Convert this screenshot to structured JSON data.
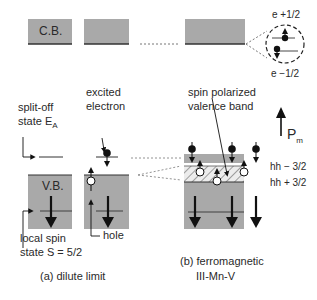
{
  "conduction_band": {
    "label": "C.B.",
    "spin_levels": {
      "up": "e +1/2",
      "down": "e −1/2"
    }
  },
  "panel_a": {
    "caption": "(a) dilute limit",
    "valence_band_label": "V.B.",
    "split_off_label_line1": "split-off",
    "split_off_label_line2": "state E",
    "split_off_subscript": "A",
    "excited_label_line1": "excited",
    "excited_label_line2": "electron",
    "local_spin_line1": "local spin",
    "local_spin_line2": "state S = 5/2",
    "hole_label": "hole"
  },
  "panel_b": {
    "caption_line1": "(b) ferromagnetic",
    "caption_line2": "III-Mn-V",
    "spin_polarized_line1": "spin polarized",
    "spin_polarized_line2": "valence band",
    "magnetization_label": "P",
    "magnetization_subscript": "m",
    "hh_minus": "hh − 3/2",
    "hh_plus": "hh + 3/2"
  },
  "colors": {
    "band_fill": "#a9a9a9",
    "band_edge": "#333333",
    "hatch_fill": "#e6e6e6",
    "ink": "#111111"
  }
}
